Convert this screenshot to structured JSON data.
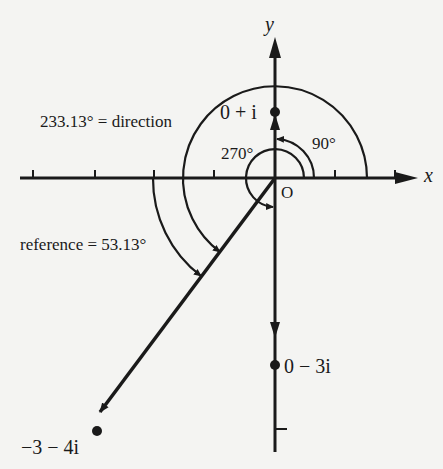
{
  "figure": {
    "axes": {
      "x_label": "x",
      "y_label": "y",
      "origin_label": "O"
    },
    "angle_labels": {
      "ninety": "90°",
      "two_seventy": "270°",
      "direction": "233.13° = direction",
      "reference": "reference = 53.13°"
    },
    "points": [
      {
        "label": "0 + i",
        "re": 0,
        "im": 1
      },
      {
        "label": "0 − 3i",
        "re": 0,
        "im": -3
      },
      {
        "label": "−3 − 4i",
        "re": -3,
        "im": -4
      }
    ],
    "colors": {
      "ink": "#1a1a1a",
      "paper": "#f4f4f2"
    }
  }
}
